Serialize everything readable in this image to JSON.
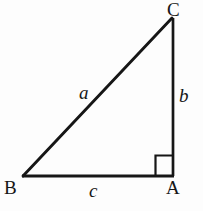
{
  "figure": {
    "kind": "right-triangle-diagram",
    "background_color": "#fdfdfd",
    "stroke_color": "#161616",
    "canvas": {
      "width": 203,
      "height": 211
    },
    "vertices": [
      {
        "id": "C",
        "label": "C",
        "x": 172,
        "y": 18
      },
      {
        "id": "B",
        "label": "B",
        "x": 23,
        "y": 176
      },
      {
        "id": "A",
        "label": "A",
        "x": 173,
        "y": 176
      }
    ],
    "sides": [
      {
        "id": "a",
        "label": "a",
        "from": "B",
        "to": "C",
        "role": "hypotenuse"
      },
      {
        "id": "b",
        "label": "b",
        "from": "C",
        "to": "A",
        "role": "leg-vertical"
      },
      {
        "id": "c",
        "label": "c",
        "from": "B",
        "to": "A",
        "role": "leg-horizontal"
      }
    ],
    "right_angle": {
      "at_vertex": "A",
      "marker": "square",
      "size": 19
    }
  }
}
